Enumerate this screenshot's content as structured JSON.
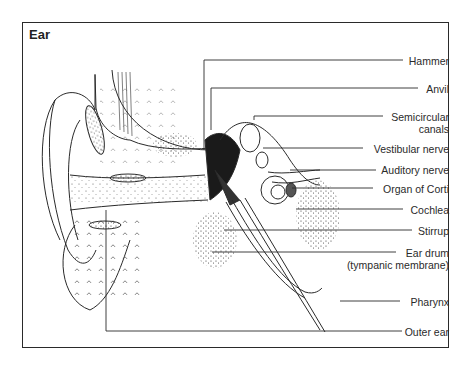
{
  "diagram": {
    "title": "Ear",
    "labels": [
      {
        "id": "hammer",
        "text": "Hammer"
      },
      {
        "id": "anvil",
        "text": "Anvil"
      },
      {
        "id": "semicircular",
        "text": "Semicircular",
        "text2": "canals"
      },
      {
        "id": "vestibular",
        "text": "Vestibular  nerve"
      },
      {
        "id": "auditory",
        "text": "Auditory nerve"
      },
      {
        "id": "corti",
        "text": "Organ  of Corti"
      },
      {
        "id": "cochlea",
        "text": "Cochlea"
      },
      {
        "id": "stirrup",
        "text": "Stirrup"
      },
      {
        "id": "eardrum",
        "text": "Ear drum",
        "text2": "(tympanic membrane)"
      },
      {
        "id": "pharynx",
        "text": "Pharynx"
      },
      {
        "id": "outer_ear",
        "text": "Outer ear"
      }
    ]
  }
}
